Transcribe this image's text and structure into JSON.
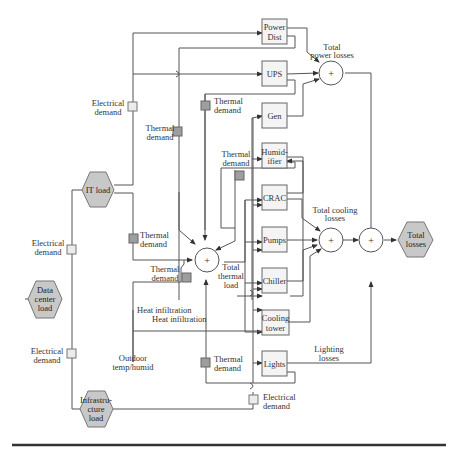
{
  "diagram": {
    "hexagons": {
      "it_load": [
        "IT load"
      ],
      "data_center_load": [
        "Data",
        "center",
        "load"
      ],
      "infrastructure_load": [
        "Infrastru-",
        "cture",
        "load"
      ],
      "total_losses": [
        "Total",
        "losses"
      ]
    },
    "boxes": {
      "power_dist": [
        "Power",
        "Dist"
      ],
      "ups": [
        "UPS"
      ],
      "gen": [
        "Gen"
      ],
      "humidifier": [
        "Humid-",
        "ifier"
      ],
      "crac": [
        "CRAC"
      ],
      "pumps": [
        "Pumps"
      ],
      "chiller": [
        "Chiller"
      ],
      "cooling_tower": [
        "Cooling",
        "tower"
      ],
      "lights": [
        "Lights"
      ]
    },
    "summing_junction_symbol": "+",
    "labels": {
      "total_power_losses": [
        "Total",
        "power losses"
      ],
      "total_cooling_losses": [
        "Total cooling",
        "losses"
      ],
      "total_thermal_load": [
        "Total",
        "thermal",
        "load"
      ],
      "lighting_losses": [
        "Lighting",
        "losses"
      ],
      "electrical_demand_it": [
        "Electrical",
        "demand"
      ],
      "electrical_demand_dc_upper": [
        "Electrical",
        "demand"
      ],
      "electrical_demand_dc_lower": [
        "Electrical",
        "demand"
      ],
      "electrical_demand_infra": [
        "Electrical",
        "demand"
      ],
      "thermal_demand_1": [
        "Thermal",
        "demand"
      ],
      "thermal_demand_2": [
        "Thermal",
        "demand"
      ],
      "thermal_demand_3": [
        "Thermal",
        "demand"
      ],
      "thermal_demand_4": [
        "Thermal",
        "demand"
      ],
      "thermal_demand_humidifier": [
        "Thermal",
        "demand"
      ],
      "thermal_demand_5": [
        "Thermal",
        "demand"
      ],
      "heat_infiltration_1": "Heat infiltration",
      "heat_infiltration_2": "Heat infiltration",
      "outdoor_temp": [
        "Outdoor",
        "temp/humid"
      ]
    },
    "colors": {
      "hexagon_fill": "#c8c8c8",
      "thermal_marker": "#9e9e9e",
      "electrical_marker": "#ececec",
      "line": "#555555"
    }
  }
}
